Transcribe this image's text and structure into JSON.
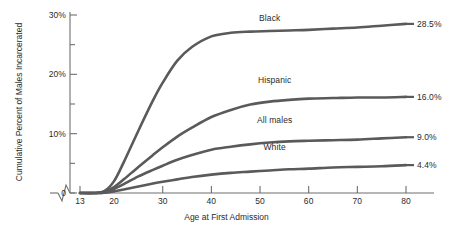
{
  "chart_data": {
    "type": "line",
    "title": "",
    "xlabel": "Age at First Admission",
    "ylabel": "Cumulative Percent of Males Incarcerated",
    "xlim": [
      13,
      80
    ],
    "ylim": [
      0,
      30
    ],
    "grid": false,
    "legend_position": "inline-right",
    "axis_break": "x-axis break between 0 and 13",
    "xticks": [
      13,
      20,
      30,
      40,
      50,
      60,
      70,
      80
    ],
    "xtick_labels": [
      "13",
      "20",
      "30",
      "40",
      "50",
      "60",
      "70",
      "80"
    ],
    "yticks": [
      0,
      5,
      10,
      15,
      20,
      25,
      30
    ],
    "ytick_labels": [
      "0",
      "",
      "10%",
      "",
      "20%",
      "",
      "30%"
    ],
    "x": [
      13,
      16,
      18,
      20,
      22,
      25,
      28,
      30,
      33,
      36,
      40,
      44,
      48,
      52,
      56,
      60,
      65,
      70,
      75,
      80
    ],
    "series": [
      {
        "name": "Black",
        "end_label": "28.5%",
        "color": "#5a5a5a",
        "values": [
          0,
          0,
          0.3,
          2.0,
          5.2,
          10.5,
          15.6,
          18.6,
          22.3,
          24.6,
          26.4,
          27.0,
          27.2,
          27.3,
          27.4,
          27.5,
          27.7,
          27.9,
          28.2,
          28.5
        ]
      },
      {
        "name": "Hispanic",
        "end_label": "16.0%",
        "color": "#5a5a5a",
        "values": [
          0,
          0,
          0.2,
          1.0,
          2.3,
          4.4,
          6.4,
          7.7,
          9.5,
          11.0,
          12.8,
          14.0,
          14.9,
          15.4,
          15.7,
          15.9,
          16.0,
          16.1,
          16.1,
          16.2
        ]
      },
      {
        "name": "All males",
        "end_label": "9.0%",
        "color": "#5a5a5a",
        "values": [
          0,
          0,
          0.1,
          0.7,
          1.5,
          2.8,
          3.9,
          4.6,
          5.6,
          6.4,
          7.3,
          7.8,
          8.2,
          8.5,
          8.7,
          8.8,
          8.9,
          9.0,
          9.2,
          9.4
        ]
      },
      {
        "name": "White",
        "end_label": "4.4%",
        "color": "#5a5a5a",
        "values": [
          0,
          0,
          0.05,
          0.3,
          0.6,
          1.1,
          1.6,
          1.9,
          2.3,
          2.7,
          3.1,
          3.4,
          3.6,
          3.8,
          4.0,
          4.1,
          4.3,
          4.4,
          4.5,
          4.7
        ]
      }
    ],
    "series_label_positions": [
      {
        "name": "Black",
        "x": 52,
        "y": 29.5
      },
      {
        "name": "Hispanic",
        "x": 53,
        "y": 19.0
      },
      {
        "name": "All males",
        "x": 53,
        "y": 12.3
      },
      {
        "name": "White",
        "x": 53,
        "y": 7.7
      }
    ]
  }
}
